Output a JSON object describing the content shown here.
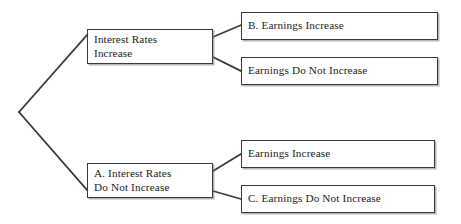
{
  "diagram": {
    "type": "decision-tree",
    "orientation": "left-to-right",
    "line_color": "#3a3a3a",
    "box_border_color": "#3a3a3a",
    "background_color": "#ffffff",
    "text_color": "#1c1c1c",
    "root": {
      "label": "",
      "vertex_x": 19,
      "vertex_y": 112
    },
    "nodes": [
      {
        "id": "interest-rates-increase",
        "level": 1,
        "branch": "upper",
        "prefix": "",
        "lines": [
          "Interest Rates",
          "Increase"
        ]
      },
      {
        "id": "interest-rates-not-increase",
        "level": 1,
        "branch": "lower",
        "prefix": "A.",
        "lines": [
          "A. Interest Rates",
          "Do Not Increase"
        ]
      },
      {
        "id": "b-earnings-increase",
        "level": 2,
        "parent": "interest-rates-increase",
        "branch": "upper",
        "prefix": "B.",
        "lines": [
          "B. Earnings Increase"
        ]
      },
      {
        "id": "earnings-do-not-increase",
        "level": 2,
        "parent": "interest-rates-increase",
        "branch": "lower",
        "prefix": "",
        "lines": [
          "Earnings Do Not Increase"
        ]
      },
      {
        "id": "earnings-increase",
        "level": 2,
        "parent": "interest-rates-not-increase",
        "branch": "upper",
        "prefix": "",
        "lines": [
          "Earnings Increase"
        ]
      },
      {
        "id": "c-earnings-do-not-increase",
        "level": 2,
        "parent": "interest-rates-not-increase",
        "branch": "lower",
        "prefix": "C.",
        "lines": [
          "C. Earnings Do Not Increase"
        ]
      }
    ],
    "edges": [
      {
        "from": "root",
        "to": "interest-rates-increase"
      },
      {
        "from": "root",
        "to": "interest-rates-not-increase"
      },
      {
        "from": "interest-rates-increase",
        "to": "b-earnings-increase"
      },
      {
        "from": "interest-rates-increase",
        "to": "earnings-do-not-increase"
      },
      {
        "from": "interest-rates-not-increase",
        "to": "earnings-increase"
      },
      {
        "from": "interest-rates-not-increase",
        "to": "c-earnings-do-not-increase"
      }
    ]
  }
}
